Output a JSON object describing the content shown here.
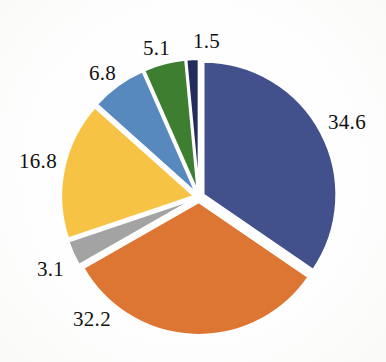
{
  "chart_data": {
    "type": "pie",
    "title": "",
    "xlabel": "",
    "ylabel": "",
    "legend": "none",
    "grid": false,
    "start_angle_deg": 0,
    "direction": "clockwise",
    "exploded": true,
    "categories": [
      "34.6",
      "32.2",
      "3.1",
      "16.8",
      "6.8",
      "5.1",
      "1.5"
    ],
    "values": [
      34.6,
      32.2,
      3.1,
      16.8,
      6.8,
      5.1,
      1.5
    ],
    "total": 100.1,
    "slices": [
      {
        "label": "34.6",
        "value": 34.6,
        "color": "#42508B",
        "name": "slice-navy"
      },
      {
        "label": "32.2",
        "value": 32.2,
        "color": "#DE7633",
        "name": "slice-orange"
      },
      {
        "label": "3.1",
        "value": 3.1,
        "color": "#A2A3A2",
        "name": "slice-gray"
      },
      {
        "label": "16.8",
        "value": 16.8,
        "color": "#F7C344",
        "name": "slice-yellow"
      },
      {
        "label": "6.8",
        "value": 6.8,
        "color": "#5788BE",
        "name": "slice-steel-blue"
      },
      {
        "label": "5.1",
        "value": 5.1,
        "color": "#3E7E31",
        "name": "slice-green"
      },
      {
        "label": "1.5",
        "value": 1.5,
        "color": "#222D5B",
        "name": "slice-dark-navy"
      }
    ]
  },
  "labels": {
    "navy": "34.6",
    "orange": "32.2",
    "gray": "3.1",
    "yellow": "16.8",
    "steel_blue": "6.8",
    "green": "5.1",
    "dark_navy": "1.5"
  },
  "colors": {
    "navy": "#42508B",
    "orange": "#DE7633",
    "gray": "#A2A3A2",
    "yellow": "#F7C344",
    "steel_blue": "#5788BE",
    "green": "#3E7E31",
    "dark_navy": "#222D5B",
    "background": "#FEFEFE",
    "label_text": "#111111"
  }
}
